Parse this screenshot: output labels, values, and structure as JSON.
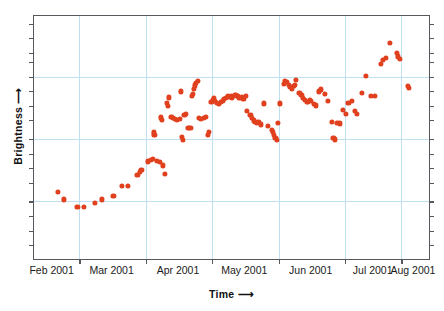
{
  "chart_data": {
    "type": "scatter",
    "title": "3C 279",
    "xlabel": "Time ⟶",
    "ylabel": "Brightness ⟶",
    "xlabel_text": "Time",
    "ylabel_text": "Brightness",
    "arrow": "⟶",
    "grid": true,
    "legend": "none",
    "xtick_labels": [
      "Feb 2001",
      "Mar 2001",
      "Apr 2001",
      "May 2001",
      "Jun 2001",
      "Jul 2001",
      "Aug 2001"
    ],
    "ytick_labels": [],
    "xlim_label_left": "Feb 2001",
    "xlim_label_right": "Aug 2001",
    "series_name": "3C 279 brightness",
    "point_color": "#e0401e",
    "grid_color": "#bfe0f0",
    "frame_color": "#55585c",
    "n_points": 122,
    "x_gridline_fractions": [
      0.115,
      0.283,
      0.451,
      0.619,
      0.787,
      0.93
    ],
    "y_gridline_fractions": [
      0.249,
      0.506,
      0.763
    ],
    "y_tick_fractions": [
      0.031,
      0.091,
      0.151,
      0.19,
      0.249,
      0.309,
      0.369,
      0.429,
      0.506,
      0.566,
      0.626,
      0.686,
      0.763,
      0.823,
      0.883,
      0.943
    ],
    "x_tick_fractions": [
      0.115,
      0.283,
      0.451,
      0.619,
      0.787,
      0.93
    ],
    "points": [
      [
        0.06,
        0.725
      ],
      [
        0.075,
        0.755
      ],
      [
        0.11,
        0.785
      ],
      [
        0.126,
        0.785
      ],
      [
        0.155,
        0.768
      ],
      [
        0.171,
        0.755
      ],
      [
        0.201,
        0.74
      ],
      [
        0.222,
        0.7
      ],
      [
        0.237,
        0.698
      ],
      [
        0.262,
        0.655
      ],
      [
        0.268,
        0.64
      ],
      [
        0.272,
        0.632
      ],
      [
        0.288,
        0.598
      ],
      [
        0.296,
        0.592
      ],
      [
        0.302,
        0.589
      ],
      [
        0.312,
        0.596
      ],
      [
        0.318,
        0.601
      ],
      [
        0.326,
        0.615
      ],
      [
        0.331,
        0.65
      ],
      [
        0.304,
        0.479
      ],
      [
        0.305,
        0.49
      ],
      [
        0.321,
        0.417
      ],
      [
        0.323,
        0.428
      ],
      [
        0.337,
        0.358
      ],
      [
        0.338,
        0.37
      ],
      [
        0.341,
        0.335
      ],
      [
        0.348,
        0.415
      ],
      [
        0.352,
        0.421
      ],
      [
        0.356,
        0.424
      ],
      [
        0.362,
        0.428
      ],
      [
        0.369,
        0.424
      ],
      [
        0.371,
        0.31
      ],
      [
        0.375,
        0.497
      ],
      [
        0.376,
        0.51
      ],
      [
        0.381,
        0.406
      ],
      [
        0.384,
        0.402
      ],
      [
        0.391,
        0.46
      ],
      [
        0.396,
        0.462
      ],
      [
        0.4,
        0.33
      ],
      [
        0.403,
        0.322
      ],
      [
        0.405,
        0.3
      ],
      [
        0.407,
        0.286
      ],
      [
        0.41,
        0.276
      ],
      [
        0.414,
        0.268
      ],
      [
        0.418,
        0.42
      ],
      [
        0.423,
        0.424
      ],
      [
        0.431,
        0.418
      ],
      [
        0.436,
        0.414
      ],
      [
        0.441,
        0.49
      ],
      [
        0.443,
        0.478
      ],
      [
        0.449,
        0.355
      ],
      [
        0.452,
        0.345
      ],
      [
        0.456,
        0.338
      ],
      [
        0.459,
        0.35
      ],
      [
        0.463,
        0.358
      ],
      [
        0.468,
        0.362
      ],
      [
        0.474,
        0.355
      ],
      [
        0.478,
        0.348
      ],
      [
        0.481,
        0.34
      ],
      [
        0.486,
        0.338
      ],
      [
        0.49,
        0.33
      ],
      [
        0.494,
        0.332
      ],
      [
        0.498,
        0.33
      ],
      [
        0.502,
        0.336
      ],
      [
        0.506,
        0.33
      ],
      [
        0.51,
        0.326
      ],
      [
        0.515,
        0.33
      ],
      [
        0.52,
        0.336
      ],
      [
        0.526,
        0.334
      ],
      [
        0.53,
        0.34
      ],
      [
        0.536,
        0.33
      ],
      [
        0.539,
        0.392
      ],
      [
        0.548,
        0.408
      ],
      [
        0.552,
        0.42
      ],
      [
        0.557,
        0.43
      ],
      [
        0.56,
        0.436
      ],
      [
        0.564,
        0.44
      ],
      [
        0.568,
        0.436
      ],
      [
        0.575,
        0.446
      ],
      [
        0.582,
        0.36
      ],
      [
        0.592,
        0.452
      ],
      [
        0.602,
        0.47
      ],
      [
        0.605,
        0.478
      ],
      [
        0.608,
        0.49
      ],
      [
        0.611,
        0.5
      ],
      [
        0.614,
        0.51
      ],
      [
        0.618,
        0.44
      ],
      [
        0.622,
        0.36
      ],
      [
        0.632,
        0.278
      ],
      [
        0.636,
        0.266
      ],
      [
        0.64,
        0.272
      ],
      [
        0.645,
        0.282
      ],
      [
        0.649,
        0.292
      ],
      [
        0.653,
        0.298
      ],
      [
        0.657,
        0.288
      ],
      [
        0.661,
        0.283
      ],
      [
        0.664,
        0.262
      ],
      [
        0.672,
        0.318
      ],
      [
        0.677,
        0.326
      ],
      [
        0.681,
        0.336
      ],
      [
        0.686,
        0.346
      ],
      [
        0.69,
        0.354
      ],
      [
        0.694,
        0.352
      ],
      [
        0.698,
        0.346
      ],
      [
        0.702,
        0.348
      ],
      [
        0.708,
        0.362
      ],
      [
        0.714,
        0.368
      ],
      [
        0.722,
        0.31
      ],
      [
        0.727,
        0.302
      ],
      [
        0.736,
        0.32
      ],
      [
        0.744,
        0.348
      ],
      [
        0.755,
        0.436
      ],
      [
        0.758,
        0.5
      ],
      [
        0.761,
        0.508
      ],
      [
        0.768,
        0.44
      ],
      [
        0.774,
        0.442
      ],
      [
        0.782,
        0.386
      ],
      [
        0.79,
        0.402
      ],
      [
        0.796,
        0.356
      ],
      [
        0.805,
        0.35
      ],
      [
        0.812,
        0.392
      ],
      [
        0.818,
        0.402
      ],
      [
        0.83,
        0.316
      ],
      [
        0.84,
        0.246
      ],
      [
        0.852,
        0.328
      ],
      [
        0.864,
        0.33
      ],
      [
        0.878,
        0.196
      ],
      [
        0.884,
        0.182
      ],
      [
        0.89,
        0.174
      ],
      [
        0.9,
        0.11
      ],
      [
        0.918,
        0.152
      ],
      [
        0.922,
        0.166
      ],
      [
        0.926,
        0.176
      ],
      [
        0.946,
        0.288
      ],
      [
        0.949,
        0.296
      ]
    ]
  }
}
